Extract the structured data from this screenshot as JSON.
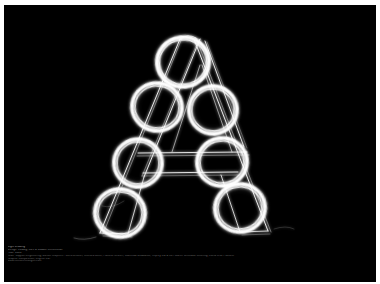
{
  "poster": {
    "background_color": "#000000",
    "frame_color": "#ffffff",
    "ink_color": "#ffffff",
    "caption_color": "#8e8e8e",
    "artwork_title": "Letter A",
    "artwork_description": "Hand-drawn outlined capital letter A with seven scribbled light-trail rings"
  },
  "caption": {
    "lines": [
      "Light Drawing",
      "Design: Ludwig, Lars & Maddie Schlossman",
      "Year: 2006",
      "Staff: Support Engineering, Motion Graphics / Wertzschuffel, Chelsea Meier, Pamela Herbert, Stanislaw Brodowski, Osprey Ltd & Co / Martin Schmidke Lettering, Lucia Cruz Platform",
      "Graphic Composition, English Ltd.",
      "www.lichtzeichnungen.com"
    ]
  },
  "artwork": {
    "letter": "A",
    "rings": [
      {
        "name": "ring-apex",
        "cx": 179,
        "cy": 57,
        "rx": 26,
        "ry": 25,
        "rot": -6
      },
      {
        "name": "ring-upper-left",
        "cx": 153,
        "cy": 102,
        "rx": 25,
        "ry": 24,
        "rot": 8
      },
      {
        "name": "ring-upper-right",
        "cx": 209,
        "cy": 105,
        "rx": 24,
        "ry": 24,
        "rot": -4
      },
      {
        "name": "ring-mid-left",
        "cx": 134,
        "cy": 158,
        "rx": 24,
        "ry": 24,
        "rot": 5
      },
      {
        "name": "ring-mid-right",
        "cx": 218,
        "cy": 157,
        "rx": 25,
        "ry": 24,
        "rot": -8
      },
      {
        "name": "ring-foot-left",
        "cx": 116,
        "cy": 208,
        "rx": 25,
        "ry": 24,
        "rot": 10
      },
      {
        "name": "ring-foot-right",
        "cx": 236,
        "cy": 203,
        "rx": 25,
        "ry": 24,
        "rot": -10
      }
    ]
  }
}
